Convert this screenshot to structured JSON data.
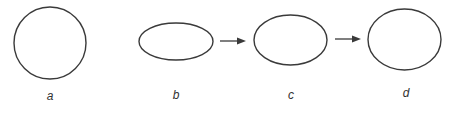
{
  "diagram": {
    "stroke_color": "#3a3a3a",
    "shapes": [
      {
        "id": "a",
        "label": "a",
        "type": "circle",
        "cx": 50,
        "cy": 43,
        "rx": 36,
        "ry": 36
      },
      {
        "id": "b",
        "label": "b",
        "type": "ellipse",
        "cx": 176,
        "cy": 41.5,
        "rx": 37,
        "ry": 18.5
      },
      {
        "id": "c",
        "label": "c",
        "type": "ellipse",
        "cx": 290.5,
        "cy": 40,
        "rx": 36.5,
        "ry": 25
      },
      {
        "id": "d",
        "label": "d",
        "type": "ellipse",
        "cx": 404.5,
        "cy": 39.5,
        "rx": 36.5,
        "ry": 30.5
      }
    ],
    "arrows": [
      {
        "from": "b",
        "to": "c",
        "x1": 220,
        "x2": 246,
        "y": 41
      },
      {
        "from": "c",
        "to": "d",
        "x1": 335,
        "x2": 361,
        "y": 39
      }
    ],
    "labels": {
      "a": "a",
      "b": "b",
      "c": "c",
      "d": "d"
    }
  }
}
